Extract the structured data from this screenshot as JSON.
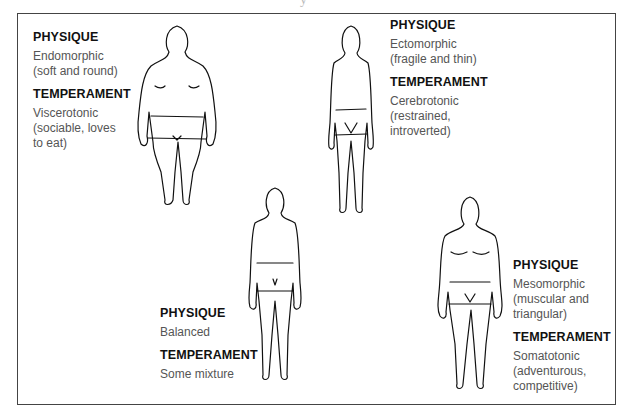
{
  "cut_caption": "y",
  "types": [
    {
      "id": "endomorph",
      "physique_label": "PHYSIQUE",
      "physique": "Endomorphic\n(soft and round)",
      "temperament_label": "TEMPERAMENT",
      "temperament": "Viscerotonic\n(sociable, loves\nto eat)"
    },
    {
      "id": "ectomorph",
      "physique_label": "PHYSIQUE",
      "physique": "Ectomorphic\n(fragile and thin)",
      "temperament_label": "TEMPERAMENT",
      "temperament": "Cerebrotonic\n(restrained,\nintroverted)"
    },
    {
      "id": "balanced",
      "physique_label": "PHYSIQUE",
      "physique": "Balanced",
      "temperament_label": "TEMPERAMENT",
      "temperament": "Some mixture"
    },
    {
      "id": "mesomorph",
      "physique_label": "PHYSIQUE",
      "physique": "Mesomorphic\n(muscular and\ntriangular)",
      "temperament_label": "TEMPERAMENT",
      "temperament": "Somatotonic\n(adventurous,\ncompetitive)"
    }
  ],
  "colors": {
    "border": "#444444",
    "heading": "#111111",
    "body_text": "#555555"
  }
}
